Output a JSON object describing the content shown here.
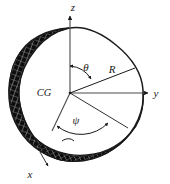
{
  "figure": {
    "title": "",
    "background_color": "#ffffff",
    "ink_color": "#1a1a1a",
    "hatch_color": "#111111",
    "axes": [
      {
        "id": "z",
        "label": "z",
        "direction": "up",
        "label_x": 73,
        "label_y": 11
      },
      {
        "id": "y",
        "label": "y",
        "direction": "right",
        "label_x": 156,
        "label_y": 97
      },
      {
        "id": "x",
        "label": "x",
        "direction": "lower-left",
        "label_x": 30,
        "label_y": 178
      }
    ],
    "origin": {
      "id": "center-of-gravity",
      "label": "CG",
      "label_x": 44,
      "label_y": 96,
      "x": 70,
      "y": 93
    },
    "vectors": [
      {
        "id": "radius",
        "label": "R",
        "label_x": 112,
        "label_y": 73
      }
    ],
    "angles": [
      {
        "id": "theta",
        "label": "θ",
        "label_x": 86,
        "label_y": 71,
        "between": "z-axis and R"
      },
      {
        "id": "psi",
        "label": "ψ",
        "label_x": 76,
        "label_y": 124,
        "between": "x-axis and R projection"
      }
    ],
    "body": {
      "id": "irregular-rigid-body",
      "description": "cut-away irregular solid body",
      "cut_surface_pattern": "crosshatch"
    }
  }
}
